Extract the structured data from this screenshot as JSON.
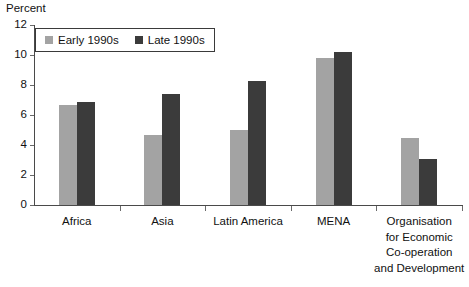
{
  "chart_data": {
    "type": "bar",
    "title": "",
    "ylabel": "Percent",
    "xlabel": "",
    "ylim": [
      0,
      12
    ],
    "yticks": [
      0,
      2,
      4,
      6,
      8,
      10,
      12
    ],
    "grid": false,
    "legend_position": "top-left",
    "categories": [
      "Africa",
      "Asia",
      "Latin America",
      "MENA",
      "Organisation for Economic Co-operation and Development"
    ],
    "category_label_lines": [
      [
        "Africa"
      ],
      [
        "Asia"
      ],
      [
        "Latin America"
      ],
      [
        "MENA"
      ],
      [
        "Organisation",
        "for Economic",
        "Co-operation",
        "and Development"
      ]
    ],
    "series": [
      {
        "name": "Early 1990s",
        "color": "#a3a3a3",
        "values": [
          6.7,
          4.7,
          5.0,
          9.8,
          4.5
        ]
      },
      {
        "name": "Late 1990s",
        "color": "#3b3b3b",
        "values": [
          6.9,
          7.4,
          8.3,
          10.2,
          3.1
        ]
      }
    ]
  },
  "axis": {
    "y_title": "Percent",
    "tick_labels": [
      "12",
      "10",
      "8",
      "6",
      "4",
      "2",
      "0"
    ]
  },
  "legend": {
    "entries": [
      {
        "label": "Early 1990s",
        "swatch": "early"
      },
      {
        "label": "Late 1990s",
        "swatch": "late"
      }
    ]
  },
  "colors": {
    "early": "#a3a3a3",
    "late": "#3b3b3b",
    "axis": "#4a4a4a",
    "text": "#111111",
    "background": "#ffffff"
  }
}
